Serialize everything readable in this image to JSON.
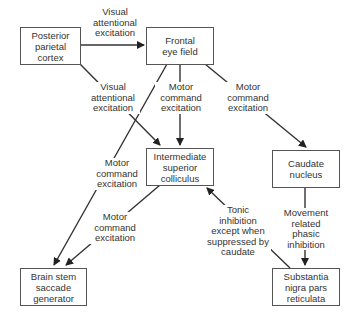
{
  "nodes": {
    "ppc": {
      "label": "Posterior\nparietal\ncortex"
    },
    "fef": {
      "label": "Frontal\neye field"
    },
    "isc": {
      "label": "Intermediate\nsuperior\ncolliculus"
    },
    "caudate": {
      "label": "Caudate\nnucleus"
    },
    "brainstem": {
      "label": "Brain stem\nsaccade\ngenerator"
    },
    "snr": {
      "label": "Substantia\nnigra pars\nreticulata"
    }
  },
  "edges": {
    "ppc_fef": {
      "label": "Visual\nattentional\nexcitation"
    },
    "ppc_isc": {
      "label": "Visual\nattentional\nexcitation"
    },
    "fef_isc": {
      "label": "Motor\ncommand\nexcitation"
    },
    "fef_caudate": {
      "label": "Motor\ncommand\nexcitation"
    },
    "fef_brainstem": {
      "label": "Motor\ncommand\nexcitation"
    },
    "isc_brainstem": {
      "label": "Motor\ncommand\nexcitation"
    },
    "caudate_snr": {
      "label": "Movement\nrelated\nphasic\ninhibition"
    },
    "snr_isc": {
      "label": "Tonic\ninhibition\nexcept when\nsuppressed by\ncaudate"
    }
  }
}
